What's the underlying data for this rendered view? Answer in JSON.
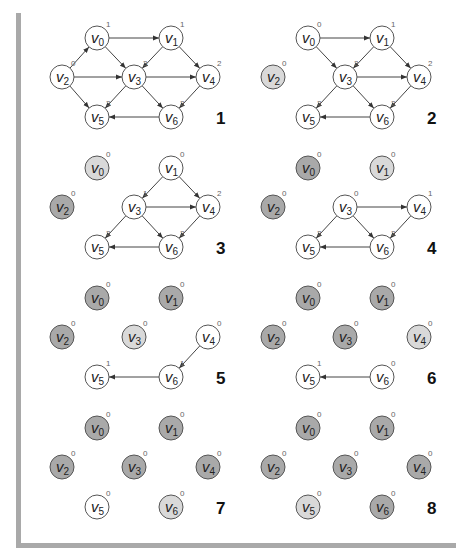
{
  "colors": {
    "unvisited": "#ffffff",
    "current": "#d9d9d9",
    "done": "#a9a9a9",
    "frame": "#a9a9a9"
  },
  "layout": {
    "node_positions": {
      "v0": [
        97,
        38
      ],
      "v1": [
        171,
        38
      ],
      "v2": [
        62,
        77
      ],
      "v3": [
        134,
        77
      ],
      "v4": [
        208,
        77
      ],
      "v5": [
        97,
        117
      ],
      "v6": [
        171,
        117
      ]
    },
    "panel_offsets": [
      [
        0,
        0
      ],
      [
        211,
        0
      ],
      [
        0,
        130
      ],
      [
        211,
        130
      ],
      [
        0,
        260
      ],
      [
        211,
        260
      ],
      [
        0,
        390
      ],
      [
        211,
        390
      ]
    ],
    "step_label_pos": [
      216,
      124
    ]
  },
  "panels": [
    {
      "step": "1",
      "nodes": {
        "v0": {
          "state": "unvisited",
          "indegree": "1"
        },
        "v1": {
          "state": "unvisited",
          "indegree": "1"
        },
        "v2": {
          "state": "unvisited",
          "indegree": "0"
        },
        "v3": {
          "state": "unvisited",
          "indegree": "3"
        },
        "v4": {
          "state": "unvisited",
          "indegree": "2"
        },
        "v5": {
          "state": "unvisited",
          "indegree": "3"
        },
        "v6": {
          "state": "unvisited",
          "indegree": "2"
        }
      },
      "edges": [
        [
          "v0",
          "v1"
        ],
        [
          "v0",
          "v3"
        ],
        [
          "v2",
          "v0"
        ],
        [
          "v2",
          "v3"
        ],
        [
          "v2",
          "v5"
        ],
        [
          "v1",
          "v3"
        ],
        [
          "v1",
          "v4"
        ],
        [
          "v3",
          "v4"
        ],
        [
          "v3",
          "v5"
        ],
        [
          "v3",
          "v6"
        ],
        [
          "v4",
          "v6"
        ],
        [
          "v6",
          "v5"
        ]
      ]
    },
    {
      "step": "2",
      "nodes": {
        "v0": {
          "state": "unvisited",
          "indegree": "0"
        },
        "v1": {
          "state": "unvisited",
          "indegree": "1"
        },
        "v2": {
          "state": "current",
          "indegree": "0"
        },
        "v3": {
          "state": "unvisited",
          "indegree": "2"
        },
        "v4": {
          "state": "unvisited",
          "indegree": "2"
        },
        "v5": {
          "state": "unvisited",
          "indegree": "2"
        },
        "v6": {
          "state": "unvisited",
          "indegree": "2"
        }
      },
      "edges": [
        [
          "v0",
          "v1"
        ],
        [
          "v0",
          "v3"
        ],
        [
          "v1",
          "v3"
        ],
        [
          "v1",
          "v4"
        ],
        [
          "v3",
          "v4"
        ],
        [
          "v3",
          "v5"
        ],
        [
          "v3",
          "v6"
        ],
        [
          "v4",
          "v6"
        ],
        [
          "v6",
          "v5"
        ]
      ]
    },
    {
      "step": "3",
      "nodes": {
        "v0": {
          "state": "current",
          "indegree": "0"
        },
        "v1": {
          "state": "unvisited",
          "indegree": "0"
        },
        "v2": {
          "state": "done",
          "indegree": "0"
        },
        "v3": {
          "state": "unvisited",
          "indegree": "1"
        },
        "v4": {
          "state": "unvisited",
          "indegree": "2"
        },
        "v5": {
          "state": "unvisited",
          "indegree": "2"
        },
        "v6": {
          "state": "unvisited",
          "indegree": "2"
        }
      },
      "edges": [
        [
          "v1",
          "v3"
        ],
        [
          "v1",
          "v4"
        ],
        [
          "v3",
          "v4"
        ],
        [
          "v3",
          "v5"
        ],
        [
          "v3",
          "v6"
        ],
        [
          "v4",
          "v6"
        ],
        [
          "v6",
          "v5"
        ]
      ]
    },
    {
      "step": "4",
      "nodes": {
        "v0": {
          "state": "done",
          "indegree": "0"
        },
        "v1": {
          "state": "current",
          "indegree": "0"
        },
        "v2": {
          "state": "done",
          "indegree": "0"
        },
        "v3": {
          "state": "unvisited",
          "indegree": "0"
        },
        "v4": {
          "state": "unvisited",
          "indegree": "1"
        },
        "v5": {
          "state": "unvisited",
          "indegree": "2"
        },
        "v6": {
          "state": "unvisited",
          "indegree": "2"
        }
      },
      "edges": [
        [
          "v3",
          "v4"
        ],
        [
          "v3",
          "v5"
        ],
        [
          "v3",
          "v6"
        ],
        [
          "v4",
          "v6"
        ],
        [
          "v6",
          "v5"
        ]
      ]
    },
    {
      "step": "5",
      "nodes": {
        "v0": {
          "state": "done",
          "indegree": "0"
        },
        "v1": {
          "state": "done",
          "indegree": "0"
        },
        "v2": {
          "state": "done",
          "indegree": "0"
        },
        "v3": {
          "state": "current",
          "indegree": "0"
        },
        "v4": {
          "state": "unvisited",
          "indegree": "0"
        },
        "v5": {
          "state": "unvisited",
          "indegree": "1"
        },
        "v6": {
          "state": "unvisited",
          "indegree": "1"
        }
      },
      "edges": [
        [
          "v4",
          "v6"
        ],
        [
          "v6",
          "v5"
        ]
      ]
    },
    {
      "step": "6",
      "nodes": {
        "v0": {
          "state": "done",
          "indegree": "0"
        },
        "v1": {
          "state": "done",
          "indegree": "0"
        },
        "v2": {
          "state": "done",
          "indegree": "0"
        },
        "v3": {
          "state": "done",
          "indegree": "0"
        },
        "v4": {
          "state": "current",
          "indegree": "0"
        },
        "v5": {
          "state": "unvisited",
          "indegree": "1"
        },
        "v6": {
          "state": "unvisited",
          "indegree": "0"
        }
      },
      "edges": [
        [
          "v6",
          "v5"
        ]
      ]
    },
    {
      "step": "7",
      "nodes": {
        "v0": {
          "state": "done",
          "indegree": "0"
        },
        "v1": {
          "state": "done",
          "indegree": "0"
        },
        "v2": {
          "state": "done",
          "indegree": "0"
        },
        "v3": {
          "state": "done",
          "indegree": "0"
        },
        "v4": {
          "state": "done",
          "indegree": "0"
        },
        "v5": {
          "state": "unvisited",
          "indegree": "0"
        },
        "v6": {
          "state": "current",
          "indegree": "0"
        }
      },
      "edges": []
    },
    {
      "step": "8",
      "nodes": {
        "v0": {
          "state": "done",
          "indegree": "0"
        },
        "v1": {
          "state": "done",
          "indegree": "0"
        },
        "v2": {
          "state": "done",
          "indegree": "0"
        },
        "v3": {
          "state": "done",
          "indegree": "0"
        },
        "v4": {
          "state": "done",
          "indegree": "0"
        },
        "v5": {
          "state": "current",
          "indegree": "0"
        },
        "v6": {
          "state": "done",
          "indegree": "0"
        }
      },
      "edges": []
    }
  ]
}
